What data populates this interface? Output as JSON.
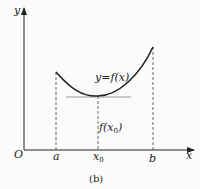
{
  "diagram": {
    "caption": "(b)",
    "axes": {
      "x_label": "x",
      "y_label": "y",
      "origin_label": "O"
    },
    "curve_label": "y=f(x)",
    "tangent_label": "f(x",
    "tangent_label_sub": "0",
    "tangent_label_close": ")",
    "x_ticks": {
      "a": "a",
      "x0": "x",
      "x0_sub": "0",
      "b": "b"
    },
    "colors": {
      "line": "#222222",
      "tangent": "#999999",
      "background": "#fbfbfb"
    }
  }
}
